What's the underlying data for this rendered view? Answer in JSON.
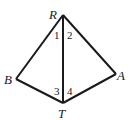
{
  "diagram": {
    "type": "geometry-kite",
    "vertices": [
      {
        "name": "R",
        "x": 63,
        "y": 15
      },
      {
        "name": "B",
        "x": 16,
        "y": 79
      },
      {
        "name": "A",
        "x": 116,
        "y": 74
      },
      {
        "name": "T",
        "x": 63,
        "y": 103
      }
    ],
    "edges": [
      [
        "R",
        "B"
      ],
      [
        "R",
        "A"
      ],
      [
        "B",
        "T"
      ],
      [
        "A",
        "T"
      ],
      [
        "R",
        "T"
      ]
    ],
    "angle_labels": [
      "1",
      "2",
      "3",
      "4"
    ],
    "vertex_labels": {
      "R": "R",
      "B": "B",
      "A": "A",
      "T": "T"
    }
  }
}
